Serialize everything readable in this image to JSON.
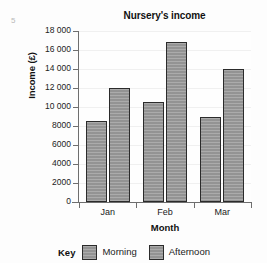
{
  "question_number": "5",
  "chart_data": {
    "type": "bar",
    "title": "Nursery's income",
    "xlabel": "Month",
    "ylabel": "Income (£)",
    "categories": [
      "Jan",
      "Feb",
      "Mar"
    ],
    "series": [
      {
        "name": "Morning",
        "values": [
          8500,
          10500,
          9000
        ],
        "color": "#9b9b9b"
      },
      {
        "name": "Afternoon",
        "values": [
          12000,
          16800,
          14000
        ],
        "color": "#9b9b9b"
      }
    ],
    "ylim": [
      0,
      18000
    ],
    "ytick_step": 2000,
    "ytick_labels": [
      "18 000",
      "16 000",
      "14 000",
      "12 000",
      "10 000",
      "8000",
      "6000",
      "4000",
      "2000",
      "0"
    ],
    "ytick_values": [
      18000,
      16000,
      14000,
      12000,
      10000,
      8000,
      6000,
      4000,
      2000,
      0
    ],
    "grid": true,
    "legend_position": "bottom",
    "legend_title": "Key"
  }
}
